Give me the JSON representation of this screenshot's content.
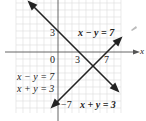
{
  "diagram": {
    "type": "system-of-linear-equations-graph",
    "axis_labels": {
      "x": "x"
    },
    "origin_label": "0",
    "ticks": {
      "x": [
        "3",
        "7"
      ],
      "y": [
        "3",
        "−7"
      ]
    },
    "lines": [
      {
        "equation": "x − y = 7",
        "x_intercept": 7,
        "y_intercept": -7
      },
      {
        "equation": "x + y = 3",
        "x_intercept": 3,
        "y_intercept": 3
      }
    ],
    "system_label": [
      "x − y = 7",
      "x + y = 3"
    ],
    "colors": {
      "grid": "#dcdcdc",
      "axis": "#555555",
      "line": "#222222"
    }
  }
}
